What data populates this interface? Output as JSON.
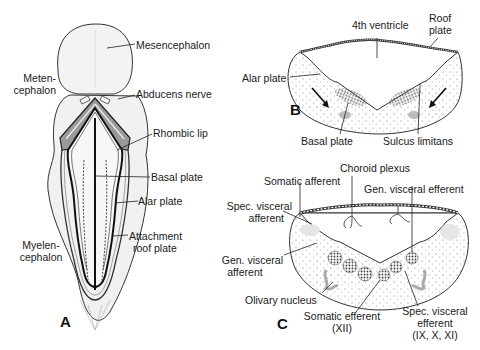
{
  "panels": {
    "a": {
      "letter": "A",
      "labels": {
        "mesencephalon": "Mesencephalon",
        "metencephalon_1": "Meten-",
        "metencephalon_2": "cephalon",
        "abducens": "Abducens nerve",
        "rhombic_lip": "Rhombic lip",
        "basal_plate": "Basal plate",
        "alar_plate": "Alar plate",
        "attachment_1": "Attachment",
        "attachment_2": "roof plate",
        "myelencephalon_1": "Myelen-",
        "myelencephalon_2": "cephalon"
      }
    },
    "b": {
      "letter": "B",
      "labels": {
        "fourth_ventricle": "4th ventricle",
        "roof_1": "Roof",
        "roof_2": "plate",
        "alar_plate": "Alar plate",
        "basal_plate": "Basal plate",
        "sulcus_limitans": "Sulcus limitans"
      }
    },
    "c": {
      "letter": "C",
      "labels": {
        "choroid_plexus": "Choroid plexus",
        "somatic_afferent": "Somatic afferent",
        "gen_visceral_efferent": "Gen. visceral efferent",
        "spec_visceral_afferent_1": "Spec. visceral",
        "spec_visceral_afferent_2": "afferent",
        "gen_visceral_afferent_1": "Gen. visceral",
        "gen_visceral_afferent_2": "afferent",
        "olivary_nucleus": "Olivary nucleus",
        "somatic_efferent_1": "Somatic efferent",
        "somatic_efferent_2": "(XII)",
        "spec_visceral_efferent_1": "Spec. visceral",
        "spec_visceral_efferent_2": "efferent",
        "spec_visceral_efferent_3": "(IX, X, XI)"
      }
    }
  }
}
